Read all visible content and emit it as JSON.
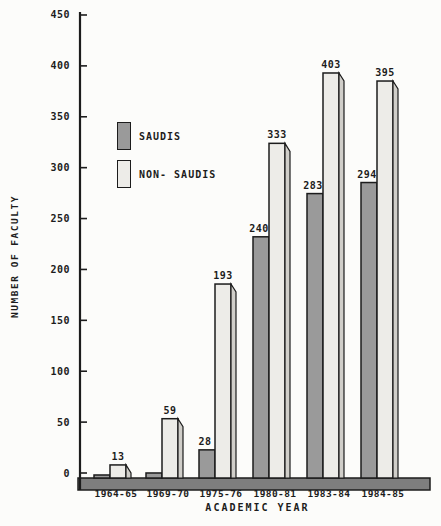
{
  "window": {
    "background": "#fcfcfa"
  },
  "colors": {
    "ink": "#1c1c1c",
    "saudi_bar": "#9a9a9a",
    "non_saudi_face": "#edece8",
    "non_saudi_side": "#d0cec9",
    "baseline_band": "#7e7e7e",
    "background": "#fcfcfa"
  },
  "y_axis": {
    "title": "NUMBER OF FACULTY"
  },
  "x_axis": {
    "title": "ACADEMIC YEAR"
  },
  "legend": {
    "items": [
      {
        "label": "SAUDIS",
        "color": "#9a9a9a"
      },
      {
        "label": "NON- SAUDIS",
        "color": "#edece8"
      }
    ]
  },
  "chart_data": {
    "type": "bar",
    "title": "",
    "xlabel": "ACADEMIC YEAR",
    "ylabel": "NUMBER OF FACULTY",
    "categories": [
      "1964-65",
      "1969-70",
      "1975-76",
      "1980-81",
      "1983-84",
      "1984-85"
    ],
    "series": [
      {
        "name": "SAUDIS",
        "color": "#9a9a9a",
        "values": [
          3,
          5,
          28,
          240,
          283,
          294
        ],
        "value_labels": [
          null,
          null,
          "28",
          "240",
          "283",
          "294"
        ]
      },
      {
        "name": "NON-SAUDIS",
        "color": "#edece8",
        "side_color": "#d0cec9",
        "values": [
          13,
          59,
          193,
          333,
          403,
          395
        ],
        "value_labels": [
          "13",
          "59",
          "193",
          "333",
          "403",
          "395"
        ]
      }
    ],
    "ylim": [
      0,
      450
    ],
    "yticks": [
      0,
      50,
      100,
      150,
      200,
      250,
      300,
      350,
      400,
      450
    ],
    "grid": false,
    "legend_position": "inside upper-left",
    "style": "scanned monochrome 3d bars"
  }
}
